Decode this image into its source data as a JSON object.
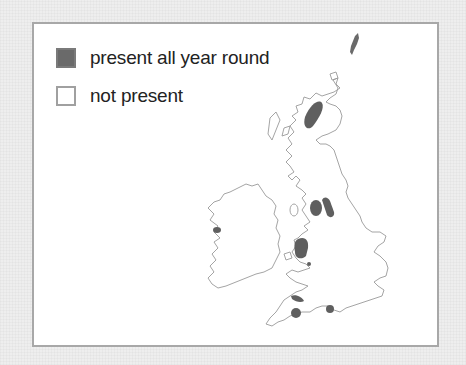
{
  "legend": {
    "items": [
      {
        "label": "present all year round",
        "swatch": "filled",
        "color": "#6a6a6a"
      },
      {
        "label": "not present",
        "swatch": "empty",
        "color": "#ffffff"
      }
    ]
  },
  "map": {
    "region": "Great Britain and Ireland",
    "coastline_color": "#999999",
    "presence_color": "#5f5f5f",
    "presence_areas": [
      "Scottish Highlands (Cairngorms)",
      "Lake District",
      "Yorkshire Dales / Pennines",
      "Western Ireland (Connemara)",
      "North Wales (Snowdonia)",
      "Shropshire / Welsh Marches",
      "South Wales",
      "Dartmoor",
      "New Forest"
    ]
  },
  "colors": {
    "background": "#eeeeee",
    "frame_border": "#a8a8a8",
    "panel": "#ffffff"
  }
}
